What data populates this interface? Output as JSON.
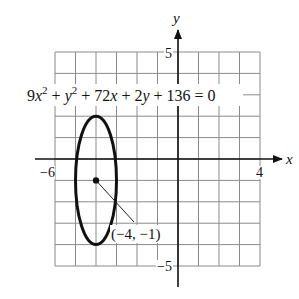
{
  "chart_data": {
    "type": "line",
    "equation": {
      "parts": [
        "9",
        "x",
        "2",
        " + ",
        "y",
        "2",
        " + 72",
        "x",
        " + 2",
        "y",
        " + 136 = 0"
      ]
    },
    "xlabel": "x",
    "ylabel": "y",
    "xlim": [
      -6,
      4
    ],
    "ylim": [
      -5,
      5
    ],
    "grid": true,
    "grid_step": 1,
    "tick_labels": {
      "x_min": "−6",
      "x_max": "4",
      "y_max": "5",
      "y_min": "−5"
    },
    "ellipse": {
      "center": [
        -4,
        -1
      ],
      "semi_axis_x": 1,
      "semi_axis_y": 3,
      "standard_form": "(x+4)^2/1 + (y+1)^2/9 = 1"
    },
    "annotations": [
      {
        "text": "(−4, −1)",
        "point": [
          -4,
          -1
        ]
      }
    ]
  }
}
